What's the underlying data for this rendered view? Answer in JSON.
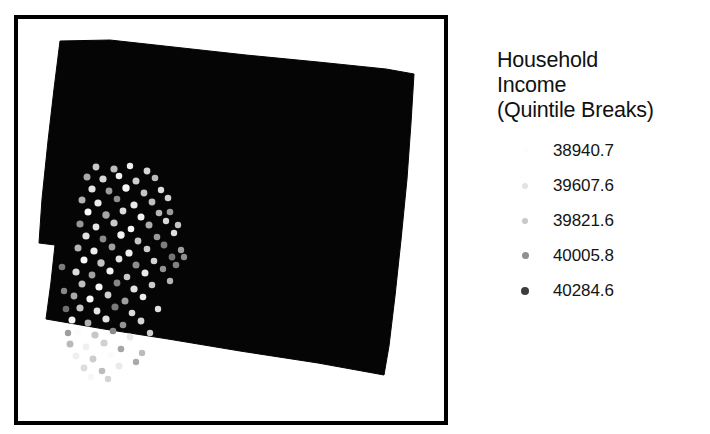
{
  "background_color": "#ffffff",
  "map": {
    "frame": {
      "border_color": "#000000",
      "fill_color": "#ffffff",
      "x": 14,
      "y": 15,
      "width": 434,
      "height": 410,
      "border_width": 4
    },
    "polygon": {
      "name": "county-boundary-polygon",
      "fill_color": "#050505",
      "stroke_color": "#050505",
      "points": [
        [
          42,
          22
        ],
        [
          92,
          21
        ],
        [
          228,
          36
        ],
        [
          300,
          43
        ],
        [
          368,
          50
        ],
        [
          396,
          55
        ],
        [
          393,
          104
        ],
        [
          389,
          160
        ],
        [
          383,
          221
        ],
        [
          377,
          277
        ],
        [
          371,
          327
        ],
        [
          366,
          356
        ],
        [
          300,
          344
        ],
        [
          222,
          332
        ],
        [
          150,
          320
        ],
        [
          86,
          310
        ],
        [
          28,
          300
        ],
        [
          33,
          263
        ],
        [
          37,
          226
        ],
        [
          21,
          224
        ],
        [
          24,
          180
        ],
        [
          30,
          122
        ],
        [
          36,
          70
        ]
      ]
    },
    "points_layer": {
      "name": "household-income-points",
      "symbol": "circle",
      "count": 104,
      "colors": [
        "#ffffff",
        "#e0e0e0",
        "#b8b8b8",
        "#8c8c8c",
        "#4f4f4f"
      ],
      "items": [
        {
          "x": 78,
          "y": 148,
          "r": 3.4,
          "c": "#c9c9c9"
        },
        {
          "x": 96,
          "y": 150,
          "r": 3.6,
          "c": "#bdbdbd"
        },
        {
          "x": 112,
          "y": 147,
          "r": 3.2,
          "c": "#efefef"
        },
        {
          "x": 129,
          "y": 152,
          "r": 3.4,
          "c": "#d6d6d6"
        },
        {
          "x": 69,
          "y": 158,
          "r": 3.5,
          "c": "#a8a8a8"
        },
        {
          "x": 85,
          "y": 160,
          "r": 3.6,
          "c": "#d9d9d9"
        },
        {
          "x": 101,
          "y": 157,
          "r": 3.3,
          "c": "#f2f2f2"
        },
        {
          "x": 118,
          "y": 162,
          "r": 3.5,
          "c": "#cfcfcf"
        },
        {
          "x": 137,
          "y": 159,
          "r": 3.3,
          "c": "#bababa"
        },
        {
          "x": 74,
          "y": 170,
          "r": 3.6,
          "c": "#e4e4e4"
        },
        {
          "x": 91,
          "y": 172,
          "r": 3.4,
          "c": "#9c9c9c"
        },
        {
          "x": 108,
          "y": 169,
          "r": 3.7,
          "c": "#f5f5f5"
        },
        {
          "x": 126,
          "y": 174,
          "r": 3.4,
          "c": "#c4c4c4"
        },
        {
          "x": 143,
          "y": 171,
          "r": 3.2,
          "c": "#dedede"
        },
        {
          "x": 64,
          "y": 181,
          "r": 3.5,
          "c": "#b2b2b2"
        },
        {
          "x": 80,
          "y": 184,
          "r": 3.6,
          "c": "#ececec"
        },
        {
          "x": 99,
          "y": 180,
          "r": 3.3,
          "c": "#8f8f8f"
        },
        {
          "x": 116,
          "y": 186,
          "r": 3.6,
          "c": "#e9e9e9"
        },
        {
          "x": 134,
          "y": 183,
          "r": 3.4,
          "c": "#c0c0c0"
        },
        {
          "x": 150,
          "y": 179,
          "r": 3.3,
          "c": "#d2d2d2"
        },
        {
          "x": 70,
          "y": 193,
          "r": 3.5,
          "c": "#fafafa"
        },
        {
          "x": 88,
          "y": 196,
          "r": 3.7,
          "c": "#a5a5a5"
        },
        {
          "x": 105,
          "y": 192,
          "r": 3.4,
          "c": "#dcdcdc"
        },
        {
          "x": 123,
          "y": 198,
          "r": 3.5,
          "c": "#f0f0f0"
        },
        {
          "x": 141,
          "y": 194,
          "r": 3.3,
          "c": "#b6b6b6"
        },
        {
          "x": 62,
          "y": 205,
          "r": 3.6,
          "c": "#979797"
        },
        {
          "x": 78,
          "y": 208,
          "r": 3.4,
          "c": "#e7e7e7"
        },
        {
          "x": 96,
          "y": 204,
          "r": 3.6,
          "c": "#cacaca"
        },
        {
          "x": 113,
          "y": 210,
          "r": 3.3,
          "c": "#f7f7f7"
        },
        {
          "x": 131,
          "y": 206,
          "r": 3.5,
          "c": "#adadad"
        },
        {
          "x": 148,
          "y": 202,
          "r": 3.2,
          "c": "#d8d8d8"
        },
        {
          "x": 68,
          "y": 217,
          "r": 3.6,
          "c": "#e1e1e1"
        },
        {
          "x": 85,
          "y": 220,
          "r": 3.4,
          "c": "#8a8a8a"
        },
        {
          "x": 103,
          "y": 216,
          "r": 3.7,
          "c": "#f4f4f4"
        },
        {
          "x": 120,
          "y": 222,
          "r": 3.4,
          "c": "#c6c6c6"
        },
        {
          "x": 139,
          "y": 218,
          "r": 3.3,
          "c": "#9a9a9a"
        },
        {
          "x": 156,
          "y": 214,
          "r": 3.2,
          "c": "#dfdfdf"
        },
        {
          "x": 60,
          "y": 229,
          "r": 3.5,
          "c": "#b4b4b4"
        },
        {
          "x": 76,
          "y": 232,
          "r": 3.6,
          "c": "#eeeeee"
        },
        {
          "x": 94,
          "y": 228,
          "r": 3.4,
          "c": "#a0a0a0"
        },
        {
          "x": 111,
          "y": 234,
          "r": 3.6,
          "c": "#f1f1f1"
        },
        {
          "x": 129,
          "y": 230,
          "r": 3.3,
          "c": "#cdcdcd"
        },
        {
          "x": 146,
          "y": 226,
          "r": 3.4,
          "c": "#7e7e7e"
        },
        {
          "x": 163,
          "y": 231,
          "r": 3.2,
          "c": "#9e9e9e"
        },
        {
          "x": 66,
          "y": 241,
          "r": 3.5,
          "c": "#f8f8f8"
        },
        {
          "x": 83,
          "y": 244,
          "r": 3.7,
          "c": "#c2c2c2"
        },
        {
          "x": 101,
          "y": 240,
          "r": 3.4,
          "c": "#e5e5e5"
        },
        {
          "x": 118,
          "y": 246,
          "r": 3.5,
          "c": "#8d8d8d"
        },
        {
          "x": 136,
          "y": 242,
          "r": 3.3,
          "c": "#d4d4d4"
        },
        {
          "x": 154,
          "y": 238,
          "r": 3.4,
          "c": "#757575"
        },
        {
          "x": 58,
          "y": 253,
          "r": 3.6,
          "c": "#dbdbdb"
        },
        {
          "x": 74,
          "y": 256,
          "r": 3.4,
          "c": "#a2a2a2"
        },
        {
          "x": 92,
          "y": 252,
          "r": 3.6,
          "c": "#f3f3f3"
        },
        {
          "x": 109,
          "y": 258,
          "r": 3.3,
          "c": "#c8c8c8"
        },
        {
          "x": 127,
          "y": 254,
          "r": 3.5,
          "c": "#ebebeb"
        },
        {
          "x": 145,
          "y": 250,
          "r": 3.2,
          "c": "#929292"
        },
        {
          "x": 64,
          "y": 265,
          "r": 3.5,
          "c": "#bebebe"
        },
        {
          "x": 81,
          "y": 268,
          "r": 3.6,
          "c": "#f6f6f6"
        },
        {
          "x": 99,
          "y": 264,
          "r": 3.4,
          "c": "#868686"
        },
        {
          "x": 116,
          "y": 270,
          "r": 3.6,
          "c": "#e2e2e2"
        },
        {
          "x": 134,
          "y": 266,
          "r": 3.3,
          "c": "#cbcbcb"
        },
        {
          "x": 56,
          "y": 277,
          "r": 3.4,
          "c": "#aaaaaa"
        },
        {
          "x": 72,
          "y": 280,
          "r": 3.6,
          "c": "#f9f9f9"
        },
        {
          "x": 90,
          "y": 276,
          "r": 3.4,
          "c": "#d0d0d0"
        },
        {
          "x": 107,
          "y": 282,
          "r": 3.5,
          "c": "#9f9f9f"
        },
        {
          "x": 125,
          "y": 278,
          "r": 3.3,
          "c": "#ededed"
        },
        {
          "x": 62,
          "y": 289,
          "r": 3.6,
          "c": "#c3c3c3"
        },
        {
          "x": 79,
          "y": 292,
          "r": 3.4,
          "c": "#e6e6e6"
        },
        {
          "x": 97,
          "y": 288,
          "r": 3.6,
          "c": "#7a7a7a"
        },
        {
          "x": 114,
          "y": 294,
          "r": 3.3,
          "c": "#dadada"
        },
        {
          "x": 54,
          "y": 301,
          "r": 3.5,
          "c": "#f5f5f5"
        },
        {
          "x": 70,
          "y": 304,
          "r": 3.4,
          "c": "#b0b0b0"
        },
        {
          "x": 88,
          "y": 300,
          "r": 3.6,
          "c": "#e3e3e3"
        },
        {
          "x": 105,
          "y": 306,
          "r": 3.3,
          "c": "#949494"
        },
        {
          "x": 123,
          "y": 302,
          "r": 3.4,
          "c": "#d5d5d5"
        },
        {
          "x": 60,
          "y": 313,
          "r": 3.5,
          "c": "#fcfcfc"
        },
        {
          "x": 77,
          "y": 316,
          "r": 3.6,
          "c": "#c7c7c7"
        },
        {
          "x": 95,
          "y": 312,
          "r": 3.3,
          "c": "#8b8b8b"
        },
        {
          "x": 112,
          "y": 318,
          "r": 3.4,
          "c": "#e8e8e8"
        },
        {
          "x": 52,
          "y": 325,
          "r": 3.5,
          "c": "#b9b9b9"
        },
        {
          "x": 68,
          "y": 328,
          "r": 3.4,
          "c": "#f0f0f0"
        },
        {
          "x": 86,
          "y": 324,
          "r": 3.6,
          "c": "#d1d1d1"
        },
        {
          "x": 103,
          "y": 330,
          "r": 3.3,
          "c": "#a6a6a6"
        },
        {
          "x": 58,
          "y": 337,
          "r": 3.5,
          "c": "#efefef"
        },
        {
          "x": 75,
          "y": 340,
          "r": 3.4,
          "c": "#cccccc"
        },
        {
          "x": 93,
          "y": 336,
          "r": 3.3,
          "c": "#fbfbfb"
        },
        {
          "x": 66,
          "y": 349,
          "r": 3.4,
          "c": "#dddddd"
        },
        {
          "x": 84,
          "y": 352,
          "r": 3.3,
          "c": "#bcbcbc"
        },
        {
          "x": 101,
          "y": 347,
          "r": 3.5,
          "c": "#eaeaea"
        },
        {
          "x": 118,
          "y": 343,
          "r": 3.2,
          "c": "#a9a9a9"
        },
        {
          "x": 73,
          "y": 358,
          "r": 3.3,
          "c": "#f7f7f7"
        },
        {
          "x": 90,
          "y": 360,
          "r": 3.2,
          "c": "#d3d3d3"
        },
        {
          "x": 152,
          "y": 193,
          "r": 3.3,
          "c": "#9b9b9b"
        },
        {
          "x": 160,
          "y": 206,
          "r": 3.2,
          "c": "#c5c5c5"
        },
        {
          "x": 158,
          "y": 246,
          "r": 3.3,
          "c": "#828282"
        },
        {
          "x": 166,
          "y": 238,
          "r": 3.2,
          "c": "#8e8e8e"
        },
        {
          "x": 152,
          "y": 262,
          "r": 3.2,
          "c": "#b5b5b5"
        },
        {
          "x": 44,
          "y": 248,
          "r": 3.3,
          "c": "#7c7c7c"
        },
        {
          "x": 46,
          "y": 272,
          "r": 3.2,
          "c": "#888888"
        },
        {
          "x": 48,
          "y": 290,
          "r": 3.3,
          "c": "#6f6f6f"
        },
        {
          "x": 50,
          "y": 314,
          "r": 3.2,
          "c": "#9d9d9d"
        },
        {
          "x": 140,
          "y": 290,
          "r": 3.2,
          "c": "#e0e0e0"
        },
        {
          "x": 132,
          "y": 314,
          "r": 3.2,
          "c": "#cecece"
        },
        {
          "x": 124,
          "y": 334,
          "r": 3.2,
          "c": "#bbbbbb"
        }
      ]
    }
  },
  "legend": {
    "title": "Household\nIncome\n(Quintile Breaks)",
    "items": [
      {
        "label": "38940.7",
        "swatch_color": "#fdfdfd",
        "swatch_size": 5
      },
      {
        "label": "39607.6",
        "swatch_color": "#e3e3e3",
        "swatch_size": 6
      },
      {
        "label": "39821.6",
        "swatch_color": "#c9c9c9",
        "swatch_size": 6
      },
      {
        "label": "40005.8",
        "swatch_color": "#8f8f8f",
        "swatch_size": 7
      },
      {
        "label": "40284.6",
        "swatch_color": "#3c3c3c",
        "swatch_size": 8
      }
    ]
  }
}
